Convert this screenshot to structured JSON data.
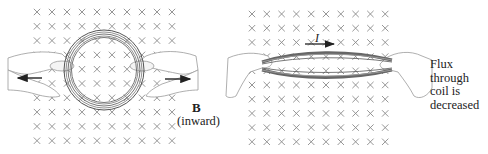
{
  "diagram": {
    "field": {
      "symbol": "×",
      "label": "B",
      "direction_label": "(inward)",
      "color": "#8a8a8a",
      "left_grid": {
        "x0": 37,
        "y0": 12,
        "cols": 10,
        "rows": 10,
        "dx": 15,
        "dy": 14.3
      },
      "right_grid": {
        "x0": 252,
        "y0": 14,
        "cols": 10,
        "rows": 10,
        "dx": 14.8,
        "dy": 14.2
      }
    },
    "left_panel": {
      "coil_shape": "circle",
      "pull_arrows": [
        "left",
        "right"
      ]
    },
    "right_panel": {
      "coil_shape": "flattened ellipse",
      "current_label": "I",
      "current_direction": "right",
      "caption_lines": [
        "Flux",
        "through",
        "coil is",
        "decreased"
      ]
    }
  }
}
